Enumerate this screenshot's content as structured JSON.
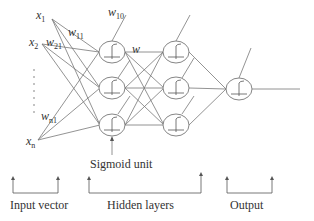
{
  "diagram": {
    "type": "neural-network",
    "inputs": [
      {
        "name": "x",
        "sub": "1"
      },
      {
        "name": "x",
        "sub": "2"
      },
      {
        "name": "x",
        "sub": "n"
      }
    ],
    "weights": [
      {
        "name": "w",
        "sub": "10"
      },
      {
        "name": "w",
        "sub": "11"
      },
      {
        "name": "w",
        "sub": "21"
      },
      {
        "name": "w",
        "sub": "n1"
      },
      {
        "name": "w",
        "sub": ""
      }
    ],
    "hidden_layers": 2,
    "nodes_per_hidden_layer": 3,
    "output_nodes": 1,
    "annotation": "Sigmoid unit",
    "groups": [
      {
        "label": "Input vector"
      },
      {
        "label": "Hidden layers"
      },
      {
        "label": "Output"
      }
    ],
    "stroke_color": "#666666"
  }
}
